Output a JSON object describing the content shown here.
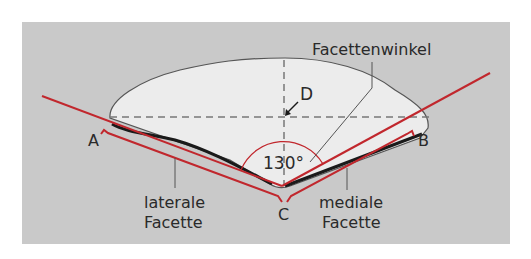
{
  "figure": {
    "colors": {
      "background": "#ffffff",
      "panel": "#c9c9c9",
      "shape_fill": "#ececec",
      "shape_outline": "#555555",
      "red": "#c1272d",
      "dark": "#1a1a1a",
      "dash": "#777777"
    },
    "labels": {
      "facet_angle": "Facettenwinkel",
      "angle_value": "130°",
      "point_a": "A",
      "point_b": "B",
      "point_c": "C",
      "point_d": "D",
      "lateral_line1": "laterale",
      "lateral_line2": "Facette",
      "medial_line1": "mediale",
      "medial_line2": "Facette"
    }
  }
}
